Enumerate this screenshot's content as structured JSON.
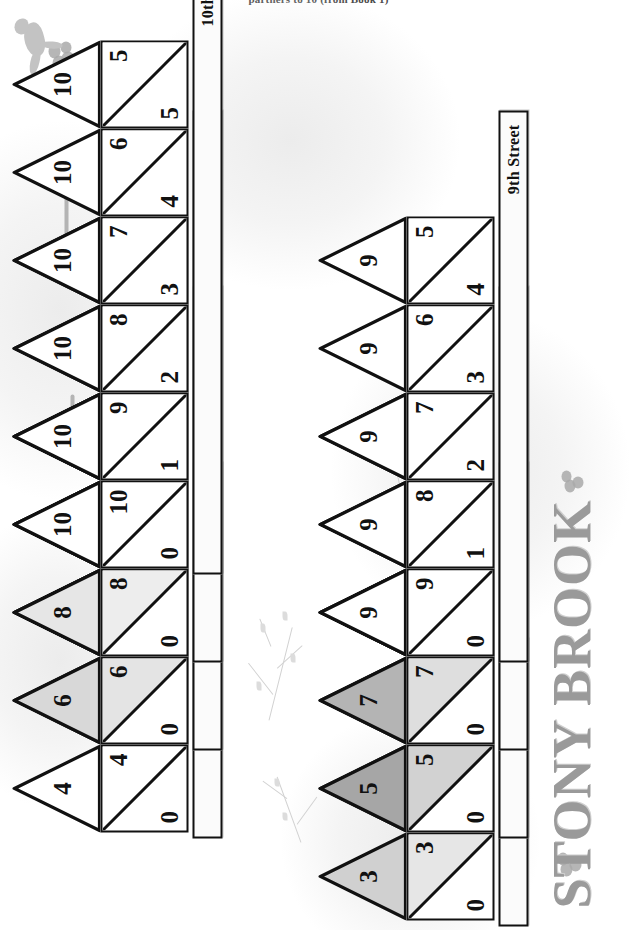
{
  "caption": "partners to 10 (from Book 1)",
  "title": "STONY BROOK",
  "colors": {
    "ink": "#111111",
    "title_gray": "#9a9a9a",
    "roof_white": "#ffffff",
    "roof_light": "#e9e9e9",
    "roof_mid_light": "#dcdcdc",
    "roof_mid": "#b9b9b9",
    "roof_dark": "#a6a6a6",
    "body_light": "#efefef",
    "body_mid": "#dcdcdc",
    "sign_bg": "#fbfbfb"
  },
  "streets": [
    {
      "id": "3rd",
      "label": "3rd Street",
      "roof_shade": "#d0d0d0",
      "body_shade": "#e6e6e6",
      "total": 3,
      "houses": [
        {
          "roof": "3",
          "left": "0",
          "right": "3"
        },
        {
          "roof": "3",
          "left": "1",
          "right": "2"
        }
      ]
    },
    {
      "id": "4th",
      "label": "4th Street",
      "roof_shade": "#ffffff",
      "body_shade": "#ffffff",
      "total": 4,
      "houses": [
        {
          "roof": "4",
          "left": "0",
          "right": "4"
        },
        {
          "roof": "4",
          "left": "1",
          "right": "3"
        },
        {
          "roof": "4",
          "left": "2",
          "right": "2"
        }
      ]
    },
    {
      "id": "5th",
      "label": "5th Street",
      "roof_shade": "#a6a6a6",
      "body_shade": "#d2d2d2",
      "total": 5,
      "houses": [
        {
          "roof": "5",
          "left": "0",
          "right": "5"
        },
        {
          "roof": "5",
          "left": "1",
          "right": "4"
        },
        {
          "roof": "5",
          "left": "2",
          "right": "3"
        }
      ]
    },
    {
      "id": "6th",
      "label": "6th Street",
      "roof_shade": "#d8d8d8",
      "body_shade": "#e4e4e4",
      "total": 6,
      "houses": [
        {
          "roof": "6",
          "left": "0",
          "right": "6"
        },
        {
          "roof": "6",
          "left": "1",
          "right": "5"
        },
        {
          "roof": "6",
          "left": "2",
          "right": "4"
        },
        {
          "roof": "6",
          "left": "3",
          "right": "3"
        }
      ]
    },
    {
      "id": "7th",
      "label": "7th Street",
      "roof_shade": "#b4b4b4",
      "body_shade": "#dedede",
      "total": 7,
      "houses": [
        {
          "roof": "7",
          "left": "0",
          "right": "7"
        },
        {
          "roof": "7",
          "left": "1",
          "right": "6"
        },
        {
          "roof": "7",
          "left": "2",
          "right": "5"
        },
        {
          "roof": "7",
          "left": "3",
          "right": "4"
        }
      ]
    },
    {
      "id": "8th",
      "label": "8th Street",
      "roof_shade": "#e6e6e6",
      "body_shade": "#ededed",
      "total": 8,
      "houses": [
        {
          "roof": "8",
          "left": "0",
          "right": "8"
        },
        {
          "roof": "8",
          "left": "1",
          "right": "7"
        },
        {
          "roof": "8",
          "left": "2",
          "right": "6"
        },
        {
          "roof": "8",
          "left": "3",
          "right": "5"
        },
        {
          "roof": "8",
          "left": "4",
          "right": "4"
        }
      ]
    },
    {
      "id": "9th",
      "label": "9th Street",
      "roof_shade": "#ffffff",
      "body_shade": "#ffffff",
      "total": 9,
      "houses": [
        {
          "roof": "9",
          "left": "0",
          "right": "9"
        },
        {
          "roof": "9",
          "left": "1",
          "right": "8"
        },
        {
          "roof": "9",
          "left": "2",
          "right": "7"
        },
        {
          "roof": "9",
          "left": "3",
          "right": "6"
        },
        {
          "roof": "9",
          "left": "4",
          "right": "5"
        }
      ]
    },
    {
      "id": "10th",
      "label": "10th Street",
      "roof_shade": "#ffffff",
      "body_shade": "#ffffff",
      "total": 10,
      "houses": [
        {
          "roof": "10",
          "left": "0",
          "right": "10"
        },
        {
          "roof": "10",
          "left": "1",
          "right": "9"
        },
        {
          "roof": "10",
          "left": "2",
          "right": "8"
        },
        {
          "roof": "10",
          "left": "3",
          "right": "7"
        },
        {
          "roof": "10",
          "left": "4",
          "right": "6"
        },
        {
          "roof": "10",
          "left": "5",
          "right": "5"
        }
      ]
    }
  ],
  "layout": {
    "rows": [
      {
        "street": "3rd",
        "row": 1,
        "col_start": 1
      },
      {
        "street": "4th",
        "row": 0,
        "col_start": 2
      },
      {
        "street": "5th",
        "row": 1,
        "col_start": 2
      },
      {
        "street": "6th",
        "row": 0,
        "col_start": 3
      },
      {
        "street": "7th",
        "row": 1,
        "col_start": 3
      },
      {
        "street": "8th",
        "row": 0,
        "col_start": 4
      },
      {
        "street": "9th",
        "row": 1,
        "col_start": 4
      },
      {
        "street": "10th",
        "row": 0,
        "col_start": 5
      }
    ]
  },
  "decor": {
    "blossom_count": 4,
    "branch_count": 4,
    "hook_count": 3,
    "bird_count": 1
  }
}
